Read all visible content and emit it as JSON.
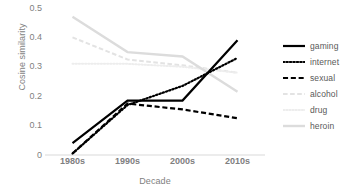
{
  "chart_data": {
    "type": "line",
    "title": "",
    "xlabel": "Decade",
    "ylabel": "Cosine similarity",
    "categories": [
      "1980s",
      "1990s",
      "2000s",
      "2010s"
    ],
    "ylim": [
      0,
      0.5
    ],
    "yticks": [
      "0",
      "0.1",
      "0.2",
      "0.3",
      "0.4",
      "0.5"
    ],
    "ytick_values": [
      0,
      0.1,
      0.2,
      0.3,
      0.4,
      0.5
    ],
    "grid": false,
    "legend_position": "right",
    "series": [
      {
        "name": "gaming",
        "values": [
          0.04,
          0.185,
          0.185,
          0.39
        ],
        "color": "#000000",
        "style": "solid",
        "width": 2.2
      },
      {
        "name": "internet",
        "values": [
          0.005,
          0.17,
          0.235,
          0.33
        ],
        "color": "#000000",
        "style": "dotted",
        "width": 2.2
      },
      {
        "name": "sexual",
        "values": [
          0.005,
          0.175,
          0.155,
          0.125
        ],
        "color": "#000000",
        "style": "dashed",
        "width": 2.2
      },
      {
        "name": "alcohol",
        "values": [
          0.4,
          0.325,
          0.305,
          0.28
        ],
        "color": "#e3e3e3",
        "style": "dashed",
        "width": 2.0
      },
      {
        "name": "drug",
        "values": [
          0.31,
          0.31,
          0.3,
          0.28
        ],
        "color": "#ededed",
        "style": "dotted",
        "width": 2.0
      },
      {
        "name": "heroin",
        "values": [
          0.47,
          0.35,
          0.335,
          0.215
        ],
        "color": "#dcdcdc",
        "style": "solid",
        "width": 2.4
      }
    ]
  },
  "axis": {
    "baseline_color": "#d9d9d9"
  },
  "legend": {
    "items": [
      {
        "label": "gaming"
      },
      {
        "label": "internet"
      },
      {
        "label": "sexual"
      },
      {
        "label": "alcohol"
      },
      {
        "label": "drug"
      },
      {
        "label": "heroin"
      }
    ]
  }
}
